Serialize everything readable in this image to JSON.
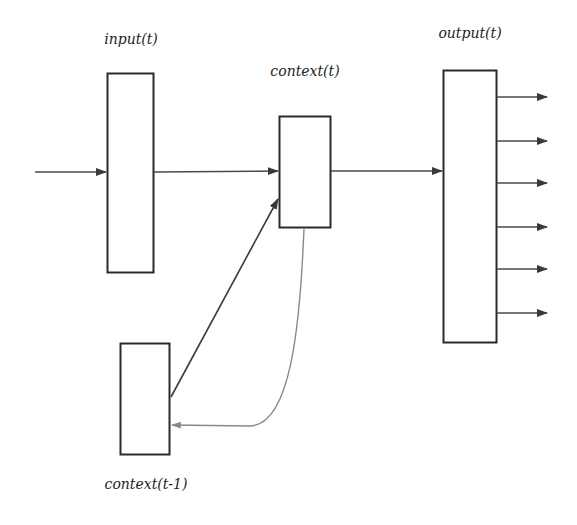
{
  "diagram": {
    "labels": {
      "input": "input(t)",
      "output": "output(t)",
      "context": "context(t)",
      "context_prev": "context(t-1)"
    },
    "nodes": [
      {
        "id": "input",
        "label": "input(t)",
        "x": 107,
        "y": 73,
        "w": 46,
        "h": 199
      },
      {
        "id": "context",
        "label": "context(t)",
        "x": 279,
        "y": 116,
        "w": 51,
        "h": 111
      },
      {
        "id": "output",
        "label": "output(t)",
        "x": 443,
        "y": 70,
        "w": 53,
        "h": 272
      },
      {
        "id": "context_prev",
        "label": "context(t-1)",
        "x": 120,
        "y": 343,
        "w": 49,
        "h": 111
      }
    ],
    "edges": [
      {
        "from": "external",
        "to": "input",
        "type": "arrow"
      },
      {
        "from": "input",
        "to": "context",
        "type": "arrow"
      },
      {
        "from": "context",
        "to": "output",
        "type": "arrow"
      },
      {
        "from": "context_prev",
        "to": "context",
        "type": "arrow",
        "style": "diagonal"
      },
      {
        "from": "context",
        "to": "context_prev",
        "type": "arrow",
        "style": "curved-copy"
      }
    ],
    "output_arrow_count": 6,
    "colors": {
      "line": "#2a2a2a",
      "curve": "#8a8a8a",
      "background": "#ffffff",
      "ghost_text": "#ececec"
    }
  }
}
